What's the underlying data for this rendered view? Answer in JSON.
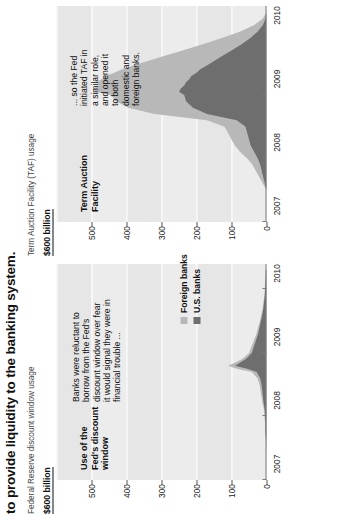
{
  "headline": "to provide liquidity to the banking system.",
  "colors": {
    "foreign_banks": "#b8b8b8",
    "us_banks": "#6e6e6e",
    "band": "#e6e6e6",
    "axis": "#7a7a7a",
    "text": "#111111"
  },
  "legend": {
    "items": [
      {
        "label": "Foreign banks",
        "color": "#b8b8b8",
        "swatch_name": "foreign-banks-swatch"
      },
      {
        "label": "U.S. banks",
        "color": "#6e6e6e",
        "swatch_name": "us-banks-swatch"
      }
    ]
  },
  "panels": [
    {
      "id": "discount-window",
      "subtitle": "Federal Reserve discount window usage",
      "unit": "$600 billion",
      "facility_label": "Use of the\nFed's discount\nwindow",
      "annotation": "Banks were reluctant to\nborrow from the Fed's\ndiscount window over fear\nit would signal they were in\nfinancial trouble ..."
    },
    {
      "id": "term-auction-facility",
      "subtitle": "Term Auction Facility (TAF) usage",
      "unit": "$600 billion",
      "facility_label": "Term Auction\nFacility",
      "annotation": "... so the Fed\ninitiated TAF in\na similar role,\nand opened it\nto both\ndomestic and\nforeign banks."
    }
  ],
  "chart_data": [
    {
      "type": "area",
      "id": "discount-window",
      "title": "Federal Reserve discount window usage",
      "subtitle": "Use of the Fed's discount window",
      "xlabel": "",
      "ylabel": "$600 billion",
      "ylim": [
        0,
        600
      ],
      "yticks": [
        0,
        100,
        200,
        300,
        400,
        500,
        600
      ],
      "ytick_labels": [
        "0",
        "100",
        "200",
        "300",
        "400",
        "500",
        "$600 billion"
      ],
      "xlim": [
        2007.0,
        2010.4
      ],
      "xticks": [
        2007,
        2008,
        2009,
        2010
      ],
      "xtick_labels": [
        "2007",
        "2008",
        "2009",
        "2010"
      ],
      "grid": true,
      "legend_position": "upper right",
      "stacked": true,
      "x": [
        2007.0,
        2007.2,
        2007.4,
        2007.6,
        2007.7,
        2007.8,
        2007.9,
        2008.0,
        2008.1,
        2008.2,
        2008.3,
        2008.4,
        2008.5,
        2008.6,
        2008.7,
        2008.75,
        2008.8,
        2008.85,
        2008.9,
        2008.95,
        2009.0,
        2009.1,
        2009.2,
        2009.3,
        2009.4,
        2009.5,
        2009.6,
        2009.7,
        2009.8,
        2009.9,
        2010.0,
        2010.1,
        2010.2,
        2010.3
      ],
      "series": [
        {
          "name": "U.S. banks",
          "color": "#6e6e6e",
          "values": [
            0,
            0,
            0,
            1,
            2,
            3,
            3,
            4,
            5,
            8,
            10,
            12,
            14,
            18,
            28,
            55,
            90,
            75,
            60,
            50,
            42,
            36,
            30,
            24,
            20,
            16,
            12,
            9,
            7,
            5,
            4,
            3,
            2,
            2
          ]
        },
        {
          "name": "Foreign banks",
          "color": "#b8b8b8",
          "values": [
            0,
            0,
            0,
            0,
            1,
            1,
            1,
            2,
            2,
            3,
            4,
            5,
            6,
            8,
            14,
            30,
            20,
            14,
            11,
            9,
            8,
            7,
            6,
            5,
            4,
            3,
            3,
            2,
            2,
            1,
            1,
            1,
            1,
            0
          ]
        }
      ]
    },
    {
      "type": "area",
      "id": "term-auction-facility",
      "title": "Term Auction Facility (TAF) usage",
      "subtitle": "Term Auction Facility",
      "xlabel": "",
      "ylabel": "$600 billion",
      "ylim": [
        0,
        600
      ],
      "yticks": [
        0,
        100,
        200,
        300,
        400,
        500,
        600
      ],
      "ytick_labels": [
        "0",
        "100",
        "200",
        "300",
        "400",
        "500",
        "$600 billion"
      ],
      "xlim": [
        2007.0,
        2010.4
      ],
      "xticks": [
        2007,
        2008,
        2009,
        2010
      ],
      "xtick_labels": [
        "2007",
        "2008",
        "2009",
        "2010"
      ],
      "grid": true,
      "legend_position": "none",
      "stacked": true,
      "x": [
        2007.0,
        2007.5,
        2007.9,
        2008.0,
        2008.1,
        2008.2,
        2008.3,
        2008.4,
        2008.5,
        2008.6,
        2008.7,
        2008.8,
        2008.9,
        2009.0,
        2009.05,
        2009.1,
        2009.15,
        2009.2,
        2009.25,
        2009.3,
        2009.35,
        2009.4,
        2009.5,
        2009.6,
        2009.7,
        2009.8,
        2009.9,
        2010.0,
        2010.1,
        2010.2,
        2010.3
      ],
      "series": [
        {
          "name": "U.S. banks",
          "color": "#6e6e6e",
          "values": [
            0,
            0,
            18,
            25,
            35,
            45,
            50,
            55,
            60,
            85,
            170,
            210,
            230,
            235,
            250,
            245,
            235,
            230,
            220,
            215,
            200,
            190,
            160,
            130,
            100,
            70,
            45,
            25,
            10,
            3,
            0
          ]
        },
        {
          "name": "Foreign banks",
          "color": "#b8b8b8",
          "values": [
            0,
            0,
            22,
            30,
            40,
            45,
            50,
            55,
            60,
            85,
            150,
            185,
            200,
            210,
            240,
            250,
            245,
            255,
            250,
            245,
            235,
            225,
            200,
            170,
            140,
            110,
            80,
            50,
            25,
            8,
            0
          ]
        }
      ]
    }
  ]
}
